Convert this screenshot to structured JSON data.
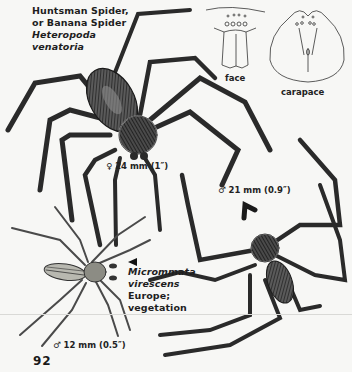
{
  "page": {
    "number": "92"
  },
  "huntsman": {
    "common_name_line1": "Huntsman Spider,",
    "common_name_line2": "or Banana Spider",
    "scientific_line1": "Heteropoda",
    "scientific_line2": "venatoria",
    "female_size": "♀ 24 mm (1″)",
    "male_size": "♂ 21 mm (0.9″)"
  },
  "detail_figures": {
    "face_caption": "face",
    "carapace_caption": "carapace"
  },
  "micrommata": {
    "scientific_line1": "Micrommata",
    "scientific_line2": "virescens",
    "range": "Europe;",
    "habitat": "vegetation",
    "male_size": "♂ 12 mm (0.5″)"
  },
  "colors": {
    "paper": "#f7f7f5",
    "ink": "#1e1e1e",
    "spider_dark": "#2b2b2b",
    "spider_mid": "#6a6a6a",
    "green_spider_body": "#9a9a92"
  }
}
